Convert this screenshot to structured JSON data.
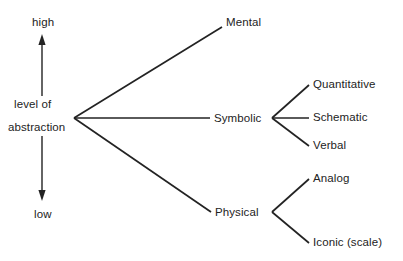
{
  "diagram": {
    "type": "tree-diagram",
    "background_color": "#ffffff",
    "stroke_color": "#232323",
    "text_color": "#232323",
    "axis": {
      "name": "level-of-abstraction-axis",
      "orientation": "vertical",
      "top_label": "high",
      "bottom_label": "low",
      "caption_line1": "level of",
      "caption_line2": "abstraction",
      "arrowheads": "both"
    },
    "root": {
      "label": "abstraction",
      "branch_point": {
        "x": 74,
        "y": 118
      }
    },
    "level1": [
      {
        "id": "mental",
        "label": "Mental",
        "x": 226,
        "y": 16,
        "anchor": {
          "x": 222,
          "y": 27
        }
      },
      {
        "id": "symbolic",
        "label": "Symbolic",
        "x": 214,
        "y": 112,
        "anchor": {
          "x": 210,
          "y": 118
        }
      },
      {
        "id": "physical",
        "label": "Physical",
        "x": 215,
        "y": 206,
        "anchor": {
          "x": 211,
          "y": 212
        }
      }
    ],
    "symbolic_children": [
      {
        "id": "quantitative",
        "label": "Quantitative",
        "x": 313,
        "y": 78,
        "anchor": {
          "x": 309,
          "y": 85
        }
      },
      {
        "id": "schematic",
        "label": "Schematic",
        "x": 313,
        "y": 111,
        "anchor": {
          "x": 309,
          "y": 118
        }
      },
      {
        "id": "verbal",
        "label": "Verbal",
        "x": 313,
        "y": 139,
        "anchor": {
          "x": 309,
          "y": 146
        }
      }
    ],
    "symbolic_branch_point": {
      "x": 272,
      "y": 118
    },
    "physical_children": [
      {
        "id": "analog",
        "label": "Analog",
        "x": 313,
        "y": 172,
        "anchor": {
          "x": 309,
          "y": 179
        }
      },
      {
        "id": "iconic-scale",
        "label": "Iconic (scale)",
        "x": 313,
        "y": 236,
        "anchor": {
          "x": 309,
          "y": 243
        }
      }
    ],
    "physical_branch_point": {
      "x": 272,
      "y": 212
    }
  }
}
